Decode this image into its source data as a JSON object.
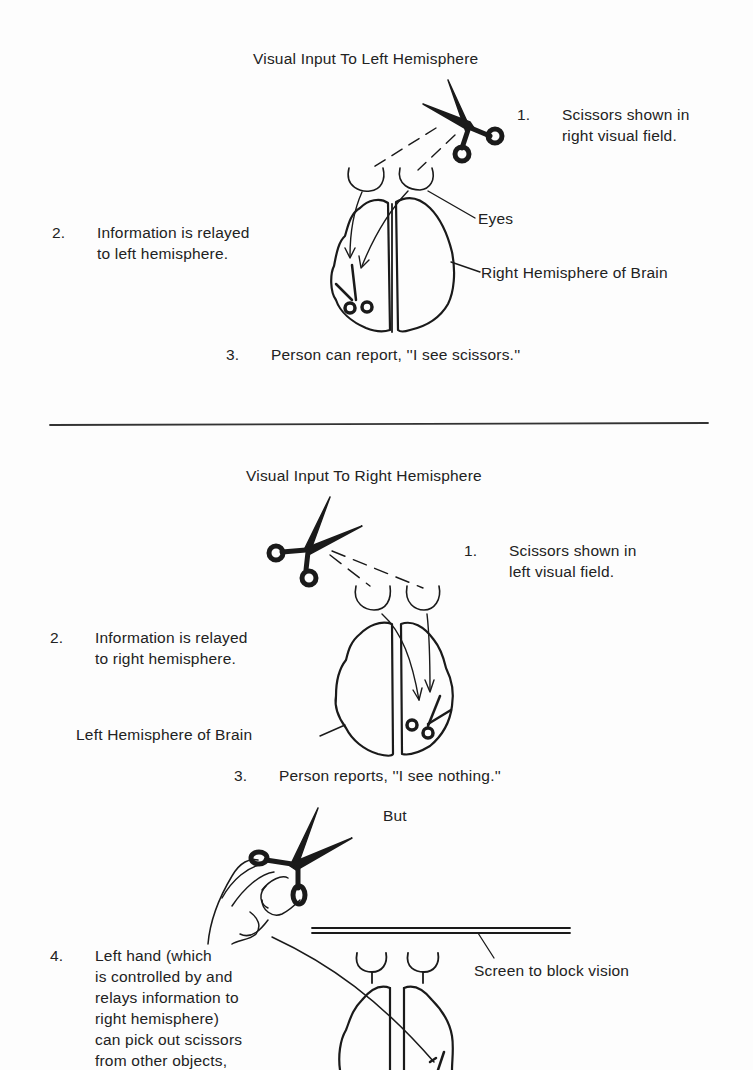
{
  "panel_left": {
    "title": "Visual Input To Left Hemisphere",
    "steps": [
      {
        "num": "1.",
        "lines": [
          "Scissors shown in",
          "right visual field."
        ]
      },
      {
        "num": "2.",
        "lines": [
          "Information is relayed",
          "to left hemisphere."
        ]
      },
      {
        "num": "3.",
        "lines": [
          "Person can report, ''I see scissors.''"
        ]
      }
    ],
    "labels": {
      "eyes": "Eyes",
      "hemisphere": "Right Hemisphere of Brain"
    }
  },
  "panel_right": {
    "title": "Visual Input To Right Hemisphere",
    "steps": [
      {
        "num": "1.",
        "lines": [
          "Scissors shown in",
          "left visual field."
        ]
      },
      {
        "num": "2.",
        "lines": [
          "Information is relayed",
          "to right  hemisphere."
        ]
      },
      {
        "num": "3.",
        "lines": [
          "Person reports, ''I see nothing.''"
        ]
      }
    ],
    "labels": {
      "hemisphere": "Left Hemisphere of Brain"
    },
    "connector": "But",
    "step4": {
      "num": "4.",
      "lines": [
        "Left hand (which",
        "is controlled by and",
        "relays information to",
        "right hemisphere)",
        "can pick out scissors",
        "from other objects,"
      ]
    },
    "screen_label": "Screen to block vision"
  }
}
